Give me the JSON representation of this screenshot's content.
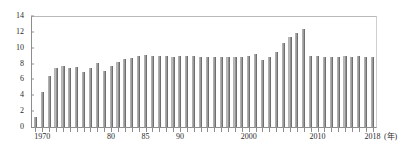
{
  "header": {
    "faint_top_text": "",
    "axis_unit_note": "(年)"
  },
  "chart_data": {
    "type": "bar",
    "title": "",
    "subtitle": "",
    "xlabel": "(年)",
    "ylabel": "",
    "ylim": [
      0,
      14
    ],
    "ytick_values": [
      14,
      12,
      10,
      8,
      6,
      4,
      2,
      0
    ],
    "ytick_labels": [
      "14",
      "12",
      "10",
      "8",
      "6",
      "4",
      "2",
      "0"
    ],
    "grid": false,
    "legend": null,
    "bar_color": "#a8a8a8",
    "bar_edge_color": "#6f6f6f",
    "axis_color": "#8d8d8d",
    "xtick_labels_shown": [
      "1970",
      "80",
      "85",
      "90",
      "2000",
      "2010",
      "2018"
    ],
    "xtick_label_years": [
      1970,
      1980,
      1985,
      1990,
      2000,
      2010,
      2018
    ],
    "categories": [
      "1969",
      "1970",
      "1971",
      "1972",
      "1973",
      "1974",
      "1975",
      "1976",
      "1977",
      "1978",
      "1979",
      "1980",
      "1981",
      "1982",
      "1983",
      "1984",
      "1985",
      "1986",
      "1987",
      "1988",
      "1989",
      "1990",
      "1991",
      "1992",
      "1993",
      "1994",
      "1995",
      "1996",
      "1997",
      "1998",
      "1999",
      "2000",
      "2001",
      "2002",
      "2003",
      "2004",
      "2005",
      "2006",
      "2007",
      "2008",
      "2009",
      "2010",
      "2011",
      "2012",
      "2013",
      "2014",
      "2015",
      "2016",
      "2017",
      "2018"
    ],
    "values": [
      1.3,
      4.4,
      6.4,
      7.5,
      7.7,
      7.4,
      7.6,
      7.0,
      7.5,
      8.1,
      7.1,
      7.7,
      8.2,
      8.6,
      8.7,
      9.0,
      9.1,
      9.0,
      8.9,
      8.9,
      8.8,
      8.9,
      8.9,
      8.9,
      8.8,
      8.8,
      8.8,
      8.8,
      8.8,
      8.8,
      8.8,
      8.9,
      9.2,
      8.4,
      8.8,
      9.4,
      10.6,
      11.3,
      11.8,
      12.3,
      8.9,
      8.9,
      8.8,
      8.8,
      8.8,
      8.9,
      8.8,
      8.9,
      8.8,
      8.8
    ]
  }
}
